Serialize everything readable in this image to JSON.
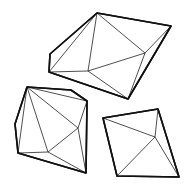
{
  "canvas": {
    "width": 189,
    "height": 187,
    "background": "#ffffff",
    "stroke": "#111111"
  },
  "shapes": [
    {
      "name": "top-polyhedron",
      "outline": "97,13 171,26 128,99 49,72 50,54",
      "edges": [
        [
          97,
          13,
          88,
          71
        ],
        [
          97,
          13,
          145,
          53
        ],
        [
          97,
          13,
          49,
          72
        ],
        [
          145,
          53,
          88,
          71
        ],
        [
          145,
          53,
          128,
          99
        ],
        [
          88,
          71,
          49,
          72
        ],
        [
          88,
          71,
          128,
          99
        ],
        [
          171,
          26,
          145,
          53
        ]
      ]
    },
    {
      "name": "left-polyhedron",
      "outline": "27,87 71,90 87,101 86,173 18,153 15,124",
      "edges": [
        [
          27,
          87,
          87,
          101
        ],
        [
          27,
          87,
          78,
          128
        ],
        [
          27,
          87,
          48,
          152
        ],
        [
          27,
          87,
          18,
          153
        ],
        [
          78,
          128,
          48,
          152
        ],
        [
          78,
          128,
          86,
          173
        ],
        [
          48,
          152,
          18,
          153
        ],
        [
          48,
          152,
          86,
          173
        ],
        [
          87,
          101,
          78,
          128
        ]
      ]
    },
    {
      "name": "right-polyhedron",
      "outline": "103,118 158,109 179,177 117,176",
      "edges": [
        [
          103,
          118,
          155,
          137
        ],
        [
          158,
          109,
          155,
          137
        ],
        [
          155,
          137,
          117,
          176
        ],
        [
          155,
          137,
          179,
          177
        ]
      ]
    }
  ]
}
